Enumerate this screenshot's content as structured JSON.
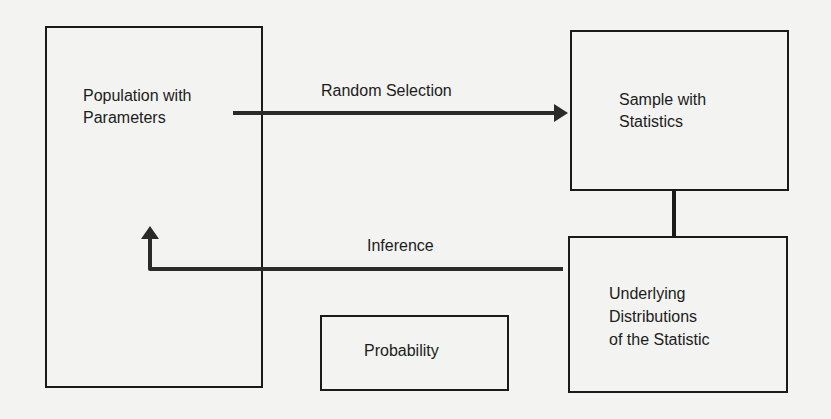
{
  "diagram": {
    "nodes": [
      {
        "id": "population",
        "lines": [
          "Population with",
          "Parameters"
        ]
      },
      {
        "id": "sample",
        "lines": [
          "Sample with",
          "Statistics"
        ]
      },
      {
        "id": "underlying",
        "lines": [
          "Underlying",
          "Distributions",
          "of the Statistic"
        ]
      },
      {
        "id": "probability",
        "lines": [
          "Probability"
        ]
      }
    ],
    "edges": [
      {
        "from": "population",
        "to": "sample",
        "label": "Random Selection",
        "arrow": true
      },
      {
        "from": "sample",
        "to": "underlying",
        "label": "",
        "arrow": false
      },
      {
        "from": "underlying",
        "to": "population",
        "label": "Inference",
        "arrow": true
      }
    ]
  },
  "colors": {
    "background": "#f3f3f1",
    "stroke": "#1a1a1a",
    "text": "#1c1c1c"
  }
}
